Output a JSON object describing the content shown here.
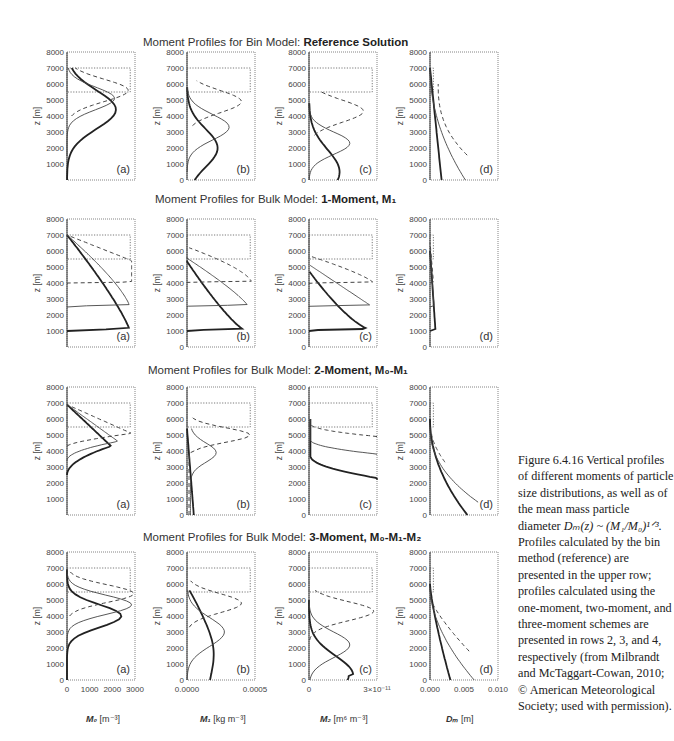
{
  "rows": [
    {
      "title_prefix": "Moment Profiles for Bin Model: ",
      "title_bold": "Reference Solution"
    },
    {
      "title_prefix": "Moment Profiles for Bulk Model: ",
      "title_bold": "1-Moment, M₁"
    },
    {
      "title_prefix": "Moment Profiles for Bulk Model: ",
      "title_bold": "2-Moment, M₀-M₁"
    },
    {
      "title_prefix": "Moment Profiles for Bulk Model: ",
      "title_bold": "3-Moment, M₀-M₁-M₂"
    }
  ],
  "panel_labels": [
    "(a)",
    "(b)",
    "(c)",
    "(d)"
  ],
  "y_axis": {
    "label": "z [m]",
    "ticks": [
      "0",
      "1000",
      "2000",
      "3000",
      "4000",
      "5000",
      "6000",
      "7000",
      "8000"
    ]
  },
  "x_axes": [
    {
      "label_sym": "M₀",
      "label_unit": " [m⁻³]",
      "ticks": [
        "0",
        "1000",
        "2000",
        "3000"
      ]
    },
    {
      "label_sym": "M₁",
      "label_unit": " [kg m⁻³]",
      "ticks": [
        "0.0000",
        "0.0005"
      ]
    },
    {
      "label_sym": "M₂",
      "label_unit": " [m⁶ m⁻³]",
      "ticks": [
        "0",
        "3×10⁻¹¹"
      ]
    },
    {
      "label_sym": "Dₘ",
      "label_unit": " [m]",
      "ticks": [
        "0.000",
        "0.005",
        "0.010"
      ]
    }
  ],
  "caption": {
    "figure_number": "Figure 6.4.16",
    "text_1": " Vertical profiles of different moments of particle size distributions, as well as of the mean mass particle diameter ",
    "formula": "Dₘ(z) ~ (M₁/M₀)¹ᐟ³.",
    "text_2": " Profiles calculated by the bin method (reference) are presented in the upper row; profiles calculated using the one-moment, two-moment, and three-moment schemes are presented in rows 2, 3, and 4, respectively (from Milbrandt and McTaggart-Cowan, 2010; © American Meteorological Society; used with permission)."
  },
  "chart_data": [
    {
      "type": "line",
      "title": "Moment Profiles for Bin Model: Reference Solution",
      "panels": [
        "M0 (a)",
        "M1 (b)",
        "M2 (c)",
        "Dm (d)"
      ],
      "ylabel": "z [m]",
      "ylim": [
        0,
        8000
      ],
      "series_styles": [
        "thick solid",
        "thin solid",
        "dashed"
      ],
      "notes": "dotted box marks 5500-7000 m source region; M0 peaks ~4400-5200 m"
    },
    {
      "type": "line",
      "title": "Moment Profiles for Bulk Model: 1-Moment, M1",
      "ylabel": "z [m]",
      "ylim": [
        0,
        8000
      ],
      "notes": "sharp fronts at ~1000, ~2500, ~4000 m"
    },
    {
      "type": "line",
      "title": "Moment Profiles for Bulk Model: 2-Moment, M0-M1",
      "ylabel": "z [m]",
      "ylim": [
        0,
        8000
      ]
    },
    {
      "type": "line",
      "title": "Moment Profiles for Bulk Model: 3-Moment, M0-M1-M2",
      "ylabel": "z [m]",
      "ylim": [
        0,
        8000
      ],
      "xlims": [
        [
          0,
          3000
        ],
        [
          0,
          0.0005
        ],
        [
          0,
          3e-11
        ],
        [
          0,
          0.01
        ]
      ]
    }
  ]
}
